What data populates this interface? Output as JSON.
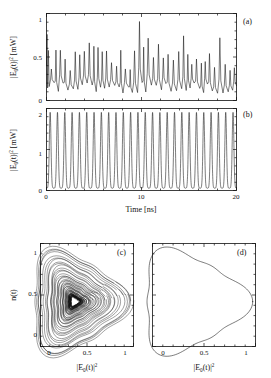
{
  "figure": {
    "panels": [
      {
        "id": "a",
        "label": "(a)",
        "ylabel_parts": {
          "pre": "|E",
          "sub": "0",
          "mid": "(t)|",
          "sup": "2",
          "post": " [mW]"
        },
        "yticks": [
          "0",
          "0.5",
          "1"
        ],
        "ylim": [
          0,
          1.25
        ],
        "xlim": [
          0,
          20
        ],
        "xticks": [
          "",
          "",
          ""
        ],
        "series_type": "chaotic-intensity-timeseries"
      },
      {
        "id": "b",
        "label": "(b)",
        "ylabel_parts": {
          "pre": "|E",
          "sub": "0",
          "mid": "(t)|",
          "sup": "2",
          "post": " [mW]"
        },
        "yticks": [
          "0",
          "1",
          "2"
        ],
        "ylim": [
          0,
          2.15
        ],
        "xlim": [
          0,
          20
        ],
        "xticks": [
          "0",
          "10",
          "20"
        ],
        "xlabel": "Time [ns]",
        "series_type": "periodic-pulse-train"
      },
      {
        "id": "c",
        "label": "(c)",
        "ylabel": "n(t)",
        "yticks": [
          "0",
          "0.5",
          "1"
        ],
        "ylim": [
          -0.12,
          1.12
        ],
        "xlabel_parts": {
          "pre": "|E",
          "sub": "0",
          "mid": "(t)|",
          "sup": "2"
        },
        "xticks": [
          "0",
          "0.5",
          "1"
        ],
        "xlim": [
          -0.12,
          1.12
        ],
        "series_type": "chaotic-attractor"
      },
      {
        "id": "d",
        "label": "(d)",
        "yticks": [
          "",
          "",
          ""
        ],
        "ylim": [
          -0.12,
          1.12
        ],
        "xlabel_parts": {
          "pre": "|E",
          "sub": "0",
          "mid": "(t)|",
          "sup": "2"
        },
        "xticks": [
          "0",
          "0.5",
          "1"
        ],
        "xlim": [
          -0.12,
          1.12
        ],
        "series_type": "limit-cycle"
      }
    ]
  },
  "chart_data": [
    {
      "type": "line",
      "panel": "a",
      "title": "",
      "xlabel": "Time [ns]",
      "ylabel": "|E0(t)|^2 [mW]",
      "xlim": [
        0,
        20
      ],
      "ylim": [
        0,
        1.25
      ],
      "xticks": [
        0,
        10,
        20
      ],
      "yticks": [
        0,
        0.5,
        1
      ],
      "grid": false,
      "description": "Chaotic irregular intensity pulsations, mean about 0.45 mW, peaks between 0.55 and 1.15 mW, minima near 0.1 mW",
      "mean": 0.45,
      "peak_max": 1.15,
      "trough_min": 0.08,
      "n_peaks": 40
    },
    {
      "type": "line",
      "panel": "b",
      "title": "",
      "xlabel": "Time [ns]",
      "ylabel": "|E0(t)|^2 [mW]",
      "xlim": [
        0,
        20
      ],
      "ylim": [
        0,
        2.15
      ],
      "xticks": [
        0,
        10,
        20
      ],
      "yticks": [
        0,
        1,
        2
      ],
      "grid": false,
      "description": "Regular periodic pulse train of sharp spikes reaching 2.05 mW with baseline near 0.06 mW",
      "period_ns": 0.77,
      "n_peaks": 26,
      "peak_value": 2.05,
      "baseline": 0.06
    },
    {
      "type": "scatter",
      "panel": "c",
      "title": "",
      "xlabel": "|E0(t)|^2",
      "ylabel": "n(t)",
      "xlim": [
        -0.12,
        1.12
      ],
      "ylim": [
        -0.12,
        1.12
      ],
      "xticks": [
        0,
        0.5,
        1
      ],
      "yticks": [
        0,
        0.5,
        1
      ],
      "grid": false,
      "description": "Dense chaotic attractor: many overlapping rounded-triangular loops spiralling outward about a focus near (0.33, 0.42)",
      "focus": [
        0.33,
        0.42
      ],
      "n_loops": 60
    },
    {
      "type": "line",
      "panel": "d",
      "title": "",
      "xlabel": "|E0(t)|^2",
      "ylabel": "n(t)",
      "xlim": [
        -0.12,
        1.12
      ],
      "ylim": [
        -0.12,
        1.12
      ],
      "xticks": [
        0,
        0.5,
        1
      ],
      "yticks": [
        0,
        0.5,
        1
      ],
      "grid": false,
      "description": "Single closed limit-cycle orbit with rounded-triangular shape, apex at right near x=1.0",
      "focus": [
        0.33,
        0.42
      ],
      "n_loops": 1
    }
  ]
}
